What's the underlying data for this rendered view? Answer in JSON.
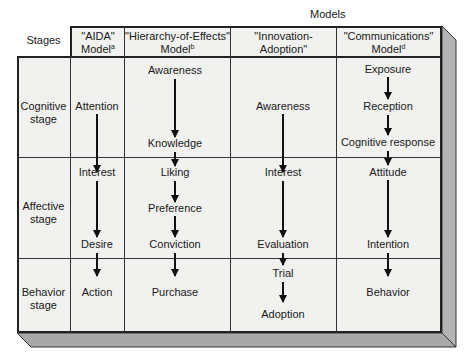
{
  "title": "Models",
  "stages_header": "Stages",
  "columns": [
    {
      "name": "\"AIDA\"",
      "sub": "Model",
      "note": "a"
    },
    {
      "name": "\"Hierarchy-of-Effects\"",
      "sub": "Model",
      "note": "b"
    },
    {
      "name": "\"Innovation-Adoption\"",
      "sub": "Model",
      "note": "c"
    },
    {
      "name": "\"Communications\"",
      "sub": "Model",
      "note": "d"
    }
  ],
  "stages": [
    {
      "line1": "Cognitive",
      "line2": "stage"
    },
    {
      "line1": "Affective",
      "line2": "stage"
    },
    {
      "line1": "Behavior",
      "line2": "stage"
    }
  ],
  "aida": [
    "Attention",
    "Interest",
    "Desire",
    "Action"
  ],
  "hierarchy": [
    "Awareness",
    "Knowledge",
    "Liking",
    "Preference",
    "Conviction",
    "Purchase"
  ],
  "innovation": [
    "Awareness",
    "Interest",
    "Evaluation",
    "Trial",
    "Adoption"
  ],
  "communications": [
    "Exposure",
    "Reception",
    "Cognitive response",
    "Attitude",
    "Intention",
    "Behavior"
  ],
  "colors": {
    "cell_bg": "#f1f1ef",
    "shadow": "#a9a9a9",
    "line": "#222222"
  }
}
